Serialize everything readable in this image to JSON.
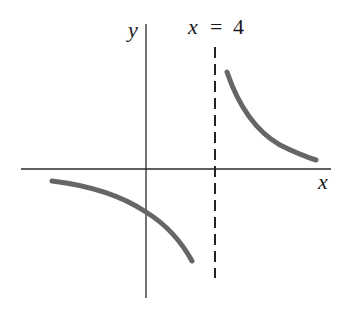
{
  "diagram": {
    "type": "function-graph",
    "axes": {
      "x_label": "x",
      "y_label": "y"
    },
    "asymptote": {
      "label_var": "x",
      "label_eq": "=",
      "label_val": "4",
      "style": "dashed"
    },
    "branches": [
      {
        "name": "left-branch",
        "region": "x < 4",
        "sign": "negative, decreasing toward -infinity near asymptote"
      },
      {
        "name": "right-branch",
        "region": "x > 4",
        "sign": "positive, decreasing toward 0"
      }
    ],
    "colors": {
      "axis": "#2a2a2a",
      "curve": "#666666",
      "background": "#ffffff"
    }
  }
}
